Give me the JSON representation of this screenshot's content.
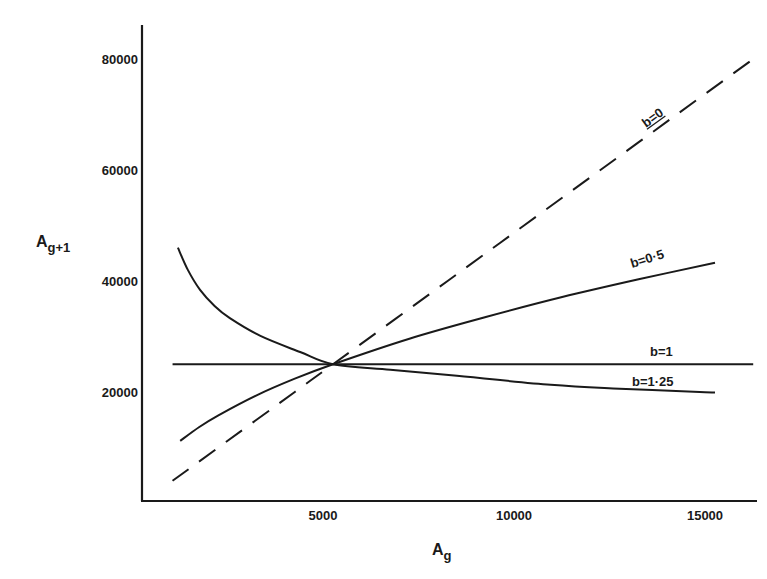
{
  "chart_data": {
    "type": "line",
    "title": "",
    "xlabel": "A",
    "xlabel_sub": "g",
    "ylabel": "A",
    "ylabel_sub": "g+1",
    "xlim": [
      0,
      16200
    ],
    "ylim": [
      0,
      85000
    ],
    "x_ticks": [
      5000,
      10000,
      15000
    ],
    "x_tick_labels": [
      "5000",
      "10000",
      "15000"
    ],
    "y_ticks": [
      20000,
      40000,
      60000,
      80000
    ],
    "y_tick_labels": [
      "20000",
      "40000",
      "60000",
      "80000"
    ],
    "grid": false,
    "legend": "none (curves labelled inline)",
    "equilibrium_point": {
      "x": 5000,
      "y": 25000
    },
    "series": [
      {
        "name": "b=0",
        "label": "b=0",
        "label_underlined": "b",
        "style": "dashed",
        "points": [
          [
            800,
            4000
          ],
          [
            2000,
            10000
          ],
          [
            4000,
            20000
          ],
          [
            5000,
            25000
          ],
          [
            8000,
            40000
          ],
          [
            10000,
            50000
          ],
          [
            12000,
            60000
          ],
          [
            14000,
            70000
          ],
          [
            16000,
            80000
          ]
        ]
      },
      {
        "name": "b=0.5",
        "label": "b=0·5",
        "style": "solid",
        "points": [
          [
            1000,
            11200
          ],
          [
            1500,
            13700
          ],
          [
            2000,
            15800
          ],
          [
            3000,
            19400
          ],
          [
            4000,
            22400
          ],
          [
            5000,
            25000
          ],
          [
            7000,
            29600
          ],
          [
            9000,
            33500
          ],
          [
            11000,
            37100
          ],
          [
            13000,
            40300
          ],
          [
            15000,
            43300
          ]
        ]
      },
      {
        "name": "b=1",
        "label": "b=1",
        "style": "solid",
        "points": [
          [
            800,
            25000
          ],
          [
            16000,
            25000
          ]
        ]
      },
      {
        "name": "b=1.25",
        "label": "b=1·25",
        "style": "solid",
        "points": [
          [
            940,
            46000
          ],
          [
            1200,
            42000
          ],
          [
            1520,
            38400
          ],
          [
            1900,
            35500
          ],
          [
            2300,
            33300
          ],
          [
            3100,
            30100
          ],
          [
            4140,
            27200
          ],
          [
            5000,
            25000
          ],
          [
            6500,
            24000
          ],
          [
            8100,
            23000
          ],
          [
            10700,
            21300
          ],
          [
            12500,
            20600
          ],
          [
            14600,
            20000
          ],
          [
            15000,
            19900
          ]
        ]
      }
    ]
  }
}
